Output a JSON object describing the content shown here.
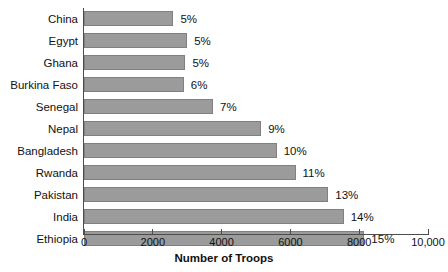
{
  "chart_data": {
    "type": "bar",
    "orientation": "horizontal",
    "title": "",
    "xlabel": "Number of Troops",
    "ylabel": "",
    "xlim": [
      0,
      10000
    ],
    "xticks": [
      0,
      2000,
      4000,
      6000,
      8000,
      10000
    ],
    "xtick_labels": [
      "0",
      "2000",
      "4000",
      "6000",
      "8000",
      "10,000"
    ],
    "grid": false,
    "legend": false,
    "bar_color": "#9b9b9b",
    "bar_border_color": "#808080",
    "axis_color": "#4d4d4d",
    "categories": [
      "China",
      "Egypt",
      "Ghana",
      "Burkina Faso",
      "Senegal",
      "Nepal",
      "Bangladesh",
      "Rwanda",
      "Pakistan",
      "India",
      "Ethiopia"
    ],
    "values": [
      2600,
      3000,
      2950,
      2900,
      3750,
      5150,
      5600,
      6150,
      7100,
      7550,
      8150
    ],
    "data_labels": [
      "5%",
      "5%",
      "5%",
      "6%",
      "7%",
      "9%",
      "10%",
      "11%",
      "13%",
      "14%",
      "15%"
    ],
    "points": [
      {
        "category": "China",
        "value": 2600,
        "label": "5%"
      },
      {
        "category": "Egypt",
        "value": 3000,
        "label": "5%"
      },
      {
        "category": "Ghana",
        "value": 2950,
        "label": "5%"
      },
      {
        "category": "Burkina Faso",
        "value": 2900,
        "label": "6%"
      },
      {
        "category": "Senegal",
        "value": 3750,
        "label": "7%"
      },
      {
        "category": "Nepal",
        "value": 5150,
        "label": "9%"
      },
      {
        "category": "Bangladesh",
        "value": 5600,
        "label": "10%"
      },
      {
        "category": "Rwanda",
        "value": 6150,
        "label": "11%"
      },
      {
        "category": "Pakistan",
        "value": 7100,
        "label": "13%"
      },
      {
        "category": "India",
        "value": 7550,
        "label": "14%"
      },
      {
        "category": "Ethiopia",
        "value": 8150,
        "label": "15%"
      }
    ]
  }
}
